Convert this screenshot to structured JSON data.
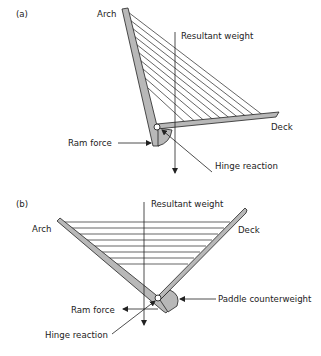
{
  "figure": {
    "panel_a": {
      "tag": "(a)",
      "labels": {
        "arch": "Arch",
        "resultant_weight": "Resultant weight",
        "deck": "Deck",
        "ram_force": "Ram force",
        "hinge_reaction": "Hinge reaction"
      }
    },
    "panel_b": {
      "tag": "(b)",
      "labels": {
        "arch": "Arch",
        "resultant_weight": "Resultant weight",
        "deck": "Deck",
        "paddle_counterweight": "Paddle counterweight",
        "ram_force": "Ram force",
        "hinge_reaction": "Hinge reaction"
      }
    },
    "colors": {
      "member_fill": "#b8b8b8",
      "stroke": "#222222",
      "background": "#ffffff"
    }
  }
}
